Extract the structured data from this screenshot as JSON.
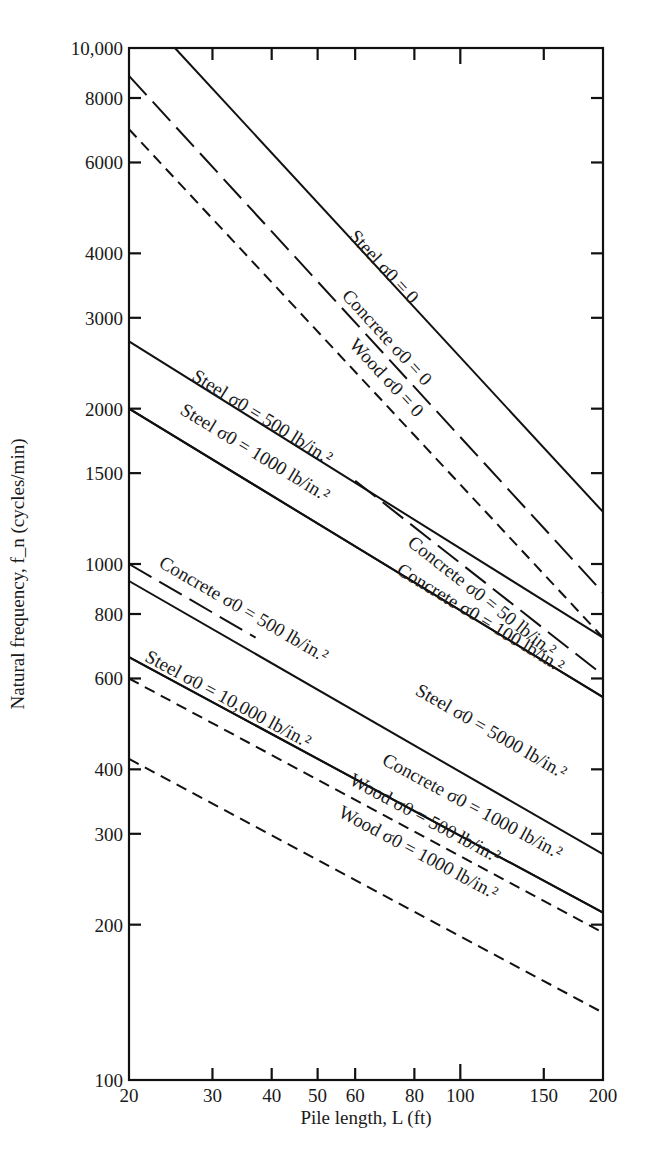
{
  "chart_data": {
    "type": "line",
    "title": "",
    "xlabel": "Pile length, L (ft)",
    "ylabel": "Natural frequency, f_n (cycles/min)",
    "xscale": "log",
    "yscale": "log",
    "xlim": [
      20,
      200
    ],
    "ylim": [
      100,
      10000
    ],
    "grid": false,
    "legend": "none (curves labeled inline)",
    "x_ticks": [
      {
        "value": 20,
        "label": "20"
      },
      {
        "value": 30,
        "label": "30"
      },
      {
        "value": 40,
        "label": "40"
      },
      {
        "value": 50,
        "label": "50"
      },
      {
        "value": 60,
        "label": "60"
      },
      {
        "value": 80,
        "label": "80"
      },
      {
        "value": 100,
        "label": "100"
      },
      {
        "value": 150,
        "label": "150"
      },
      {
        "value": 200,
        "label": "200"
      }
    ],
    "y_ticks": [
      {
        "value": 100,
        "label": "100"
      },
      {
        "value": 200,
        "label": "200"
      },
      {
        "value": 300,
        "label": "300"
      },
      {
        "value": 400,
        "label": "400"
      },
      {
        "value": 600,
        "label": "600"
      },
      {
        "value": 800,
        "label": "800"
      },
      {
        "value": 1000,
        "label": "1000"
      },
      {
        "value": 1500,
        "label": "1500"
      },
      {
        "value": 2000,
        "label": "2000"
      },
      {
        "value": 3000,
        "label": "3000"
      },
      {
        "value": 4000,
        "label": "4000"
      },
      {
        "value": 6000,
        "label": "6000"
      },
      {
        "value": 8000,
        "label": "8000"
      },
      {
        "value": 10000,
        "label": "10,000"
      }
    ],
    "series": [
      {
        "name": "Steel σ0 = 0",
        "material": "Steel",
        "sigma0": "0",
        "style": "solid",
        "points": [
          [
            25,
            10000
          ],
          [
            200,
            1262
          ]
        ]
      },
      {
        "name": "Concrete σ0 = 0",
        "material": "Concrete",
        "sigma0": "0",
        "style": "longdash",
        "points": [
          [
            20,
            8830
          ],
          [
            200,
            880
          ]
        ]
      },
      {
        "name": "Wood σ0 = 0",
        "material": "Wood",
        "sigma0": "0",
        "style": "dash",
        "points": [
          [
            20,
            6960
          ],
          [
            200,
            720
          ]
        ]
      },
      {
        "name": "Steel σ0 = 500 lb/in.²",
        "material": "Steel",
        "sigma0": "500 lb/in.²",
        "style": "solid",
        "points": [
          [
            20,
            2700
          ],
          [
            200,
            720
          ]
        ]
      },
      {
        "name": "Steel σ0 = 1000 lb/in.²",
        "material": "Steel",
        "sigma0": "1000 lb/in.²",
        "style": "solid",
        "points": [
          [
            20,
            2000
          ],
          [
            200,
            552
          ]
        ]
      },
      {
        "name": "Concrete σ0 = 50 lb/in.²",
        "material": "Concrete",
        "sigma0": "50 lb/in.²",
        "style": "longdash",
        "points": [
          [
            60,
            1450
          ],
          [
            200,
            609
          ]
        ]
      },
      {
        "name": "Concrete σ0 = 100 lb/in.²",
        "material": "Concrete",
        "sigma0": "100 lb/in.²",
        "style": "solid",
        "points": [
          [
            20,
            2000
          ],
          [
            200,
            552
          ]
        ]
      },
      {
        "name": "Concrete σ0 = 500 lb/in.²",
        "material": "Concrete",
        "sigma0": "500 lb/in.²",
        "style": "longdash",
        "points": [
          [
            20,
            1000
          ],
          [
            37,
            720
          ]
        ]
      },
      {
        "name": "Steel σ0 = 5000 lb/in.²",
        "material": "Steel",
        "sigma0": "5000 lb/in.²",
        "style": "solid",
        "points": [
          [
            20,
            927
          ],
          [
            200,
            274
          ]
        ]
      },
      {
        "name": "Steel σ0 = 10,000 lb/in.²",
        "material": "Steel",
        "sigma0": "10,000 lb/in.²",
        "style": "solid",
        "points": [
          [
            20,
            660
          ],
          [
            200,
            211
          ]
        ]
      },
      {
        "name": "Concrete σ0 = 1000 lb/in.²",
        "material": "Concrete",
        "sigma0": "1000 lb/in.²",
        "style": "solid",
        "points": [
          [
            20,
            660
          ],
          [
            200,
            211
          ]
        ]
      },
      {
        "name": "Wood σ0 = 500 lb/in.²",
        "material": "Wood",
        "sigma0": "500 lb/in.²",
        "style": "dash",
        "points": [
          [
            20,
            600
          ],
          [
            200,
            193
          ]
        ]
      },
      {
        "name": "Wood σ0 = 1000 lb/in.²",
        "material": "Wood",
        "sigma0": "1000 lb/in.²",
        "style": "dash",
        "points": [
          [
            20,
            419
          ],
          [
            200,
            135
          ]
        ]
      }
    ],
    "annotations": [
      {
        "text": "Steel σ0 = 0",
        "series": "Steel σ0 = 0",
        "at": [
          58,
          4300
        ]
      },
      {
        "text": "Concrete σ0 = 0",
        "series": "Concrete σ0 = 0",
        "at": [
          56,
          3300
        ]
      },
      {
        "text": "Wood σ0 = 0",
        "series": "Wood σ0 = 0",
        "at": [
          58,
          2650
        ]
      },
      {
        "text": "Steel σ0 = 500 lb/in.²",
        "series": "Steel σ0 = 500 lb/in.²",
        "at": [
          27,
          2280
        ]
      },
      {
        "text": "Steel σ0 = 1000 lb/in.²",
        "series": "Steel σ0 = 1000 lb/in.²",
        "at": [
          25.5,
          1960
        ]
      },
      {
        "text": "Concrete σ0 = 50 lb/in.²",
        "series": "Concrete σ0 = 50 lb/in.²",
        "at": [
          77,
          1090
        ]
      },
      {
        "text": "Concrete σ0 = 100 lb/in.²",
        "series": "Concrete σ0 = 100 lb/in.²",
        "at": [
          73,
          960
        ]
      },
      {
        "text": "Concrete σ0 = 500 lb/in.²",
        "series": "Concrete σ0 = 500 lb/in.²",
        "at": [
          23,
          990
        ]
      },
      {
        "text": "Steel σ0 = 5000 lb/in.²",
        "series": "Steel σ0 = 5000 lb/in.²",
        "at": [
          80,
          560
        ]
      },
      {
        "text": "Steel σ0 = 10,000 lb/in.²",
        "series": "Steel σ0 = 10,000 lb/in.²",
        "at": [
          21.5,
          650
        ]
      },
      {
        "text": "Concrete σ0 = 1000 lb/in.²",
        "series": "Concrete σ0 = 1000 lb/in.²",
        "at": [
          68,
          410
        ]
      },
      {
        "text": "Wood σ0 = 500 lb/in.²",
        "series": "Wood σ0 = 500 lb/in.²",
        "at": [
          58,
          375
        ]
      },
      {
        "text": "Wood σ0 = 1000 lb/in.²",
        "series": "Wood σ0 = 1000 lb/in.²",
        "at": [
          55,
          325
        ]
      }
    ]
  }
}
